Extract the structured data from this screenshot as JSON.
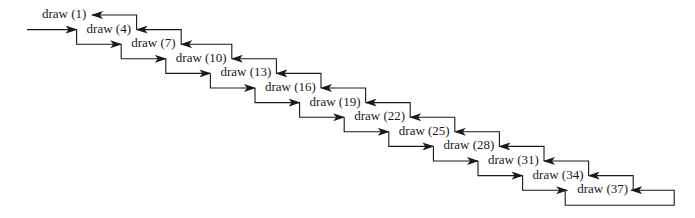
{
  "diagram": {
    "type": "recursive-call-staircase",
    "colors": {
      "line": "#1a1a1a",
      "text": "#1a1a1a",
      "background": "#ffffff"
    },
    "nodes": [
      {
        "label": "draw (1)"
      },
      {
        "label": "draw (4)"
      },
      {
        "label": "draw (7)"
      },
      {
        "label": "draw (10)"
      },
      {
        "label": "draw (13)"
      },
      {
        "label": "draw (16)"
      },
      {
        "label": "draw (19)"
      },
      {
        "label": "draw (22)"
      },
      {
        "label": "draw (25)"
      },
      {
        "label": "draw (28)"
      },
      {
        "label": "draw (31)"
      },
      {
        "label": "draw (34)"
      },
      {
        "label": "draw (37)"
      }
    ]
  }
}
